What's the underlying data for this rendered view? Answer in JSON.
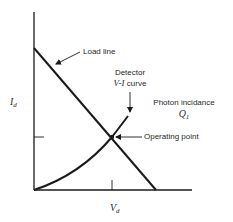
{
  "diagram": {
    "type": "detector-load-line",
    "axes": {
      "y_label": "I",
      "y_label_sub": "d",
      "x_label": "V",
      "x_label_sub": "d"
    },
    "labels": {
      "load_line": "Load line",
      "detector_line1": "Detector",
      "detector_line2_math": "V-I",
      "detector_line2_text": " curve",
      "photon_incidence": "Photon incidance",
      "q_symbol": "Q",
      "q_sub": "1",
      "operating_point": "Operating point"
    },
    "colors": {
      "stroke": "#1a1a1a",
      "text": "#2a2a2a",
      "background": "#ffffff"
    }
  }
}
